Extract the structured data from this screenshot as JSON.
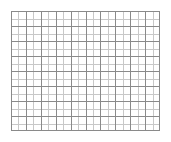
{
  "figure": {
    "name": "graph-paper-grid",
    "title": "",
    "background_color": "#ffffff"
  },
  "chart_data": {
    "type": "grid",
    "title": "",
    "subtitle": "",
    "xlabel": "",
    "ylabel": "",
    "categories": [],
    "values": [],
    "tick_labels_x": [],
    "tick_labels_y": [],
    "legend": [],
    "annotations": [],
    "grid": true,
    "legend_position": "none",
    "columns": 20,
    "rows": 16,
    "cell_width_px": 7.45,
    "cell_height_px": 7.5,
    "origin_x_px": 11,
    "origin_y_px": 11,
    "plot_width_px": 149,
    "plot_height_px": 120,
    "major_every": 2,
    "major_line_color": "#8a8a8a",
    "minor_line_color": "#c8c8c8",
    "major_line_width_px": 1,
    "minor_line_width_px": 1,
    "border_color": "#8a8a8a",
    "fill_color": "#ffffff",
    "axis_ranges": {
      "xlim": [
        0,
        20
      ],
      "ylim": [
        0,
        16
      ]
    }
  }
}
